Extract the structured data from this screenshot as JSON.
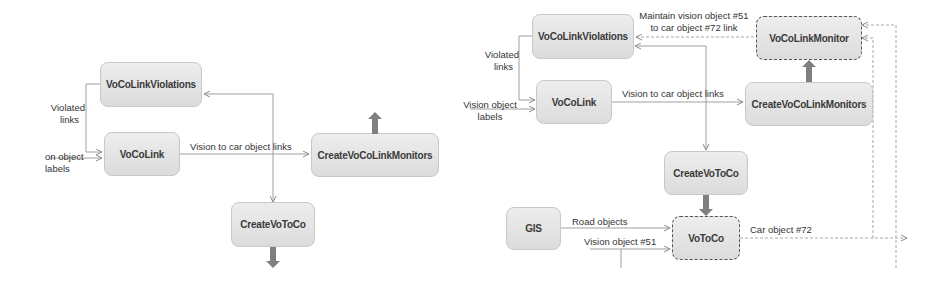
{
  "left_diagram": {
    "boxes": {
      "violations": "VoCoLinkViolations",
      "vocolink": "VoCoLink",
      "create_monitors": "CreateVoCoLinkMonitors",
      "create_votoco": "CreateVoToCo"
    },
    "labels": {
      "violated_links_1": "Violated",
      "violated_links_2": "links",
      "vision_labels_1": "on object",
      "vision_labels_2": "labels",
      "vision_to_car": "Vision to car object links"
    }
  },
  "right_diagram": {
    "boxes": {
      "violations": "VoCoLinkViolations",
      "monitor": "VoCoLinkMonitor",
      "vocolink": "VoCoLink",
      "create_monitors": "CreateVoCoLinkMonitors",
      "create_votoco": "CreateVoToCo",
      "gis": "GIS",
      "votoco": "VoToCo"
    },
    "labels": {
      "maintain_1": "Maintain vision object #51",
      "maintain_2": "to car object #72 link",
      "violated_links_1": "Violated",
      "violated_links_2": "links",
      "vision_labels_1": "Vision object",
      "vision_labels_2": "labels",
      "vision_to_car": "Vision to car object links",
      "road_objects": "Road objects",
      "vision_object_51": "Vision object #51",
      "car_object_72": "Car object #72"
    }
  },
  "colors": {
    "box_fill_top": "#ededed",
    "box_fill_bottom": "#dcdcdc",
    "wire": "#9a9a9a",
    "fat_arrow": "#7f7f7f"
  }
}
